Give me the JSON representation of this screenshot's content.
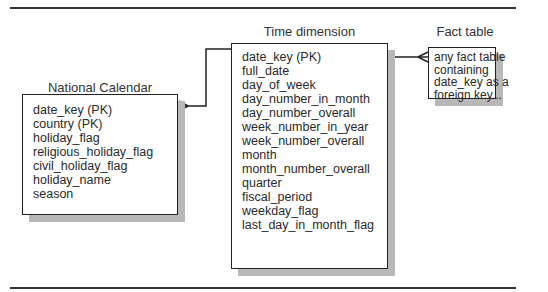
{
  "diagram": {
    "type": "entity-relationship",
    "entities": {
      "subdimension": {
        "title_lines": [
          "National Calendar",
          "Detail subdimension"
        ],
        "fields": [
          "date_key  (PK)",
          "country (PK)",
          "holiday_flag",
          "religious_holiday_flag",
          "civil_holiday_flag",
          "holiday_name",
          "season"
        ]
      },
      "time_dimension": {
        "title": "Time dimension",
        "fields": [
          "date_key (PK)",
          "full_date",
          "day_of_week",
          "day_number_in_month",
          "day_number_overall",
          "week_number_in_year",
          "week_number_overall",
          "month",
          "month_number_overall",
          "quarter",
          "fiscal_period",
          "weekday_flag",
          "last_day_in_month_flag"
        ]
      },
      "fact_table": {
        "title": "Fact table",
        "lines": [
          "any fact table",
          "containing",
          "date_key as a",
          "foreign key..."
        ]
      }
    },
    "relationships": [
      {
        "from": "time_dimension",
        "to": "subdimension",
        "cardinality": "one-to-many",
        "crowfoot_at": "subdimension"
      },
      {
        "from": "time_dimension",
        "to": "fact_table",
        "cardinality": "one-to-many",
        "crowfoot_at": "fact_table"
      }
    ],
    "colors": {
      "line": "#222222",
      "shadow": "#b8b8b8",
      "text": "#2a2a2a"
    }
  }
}
